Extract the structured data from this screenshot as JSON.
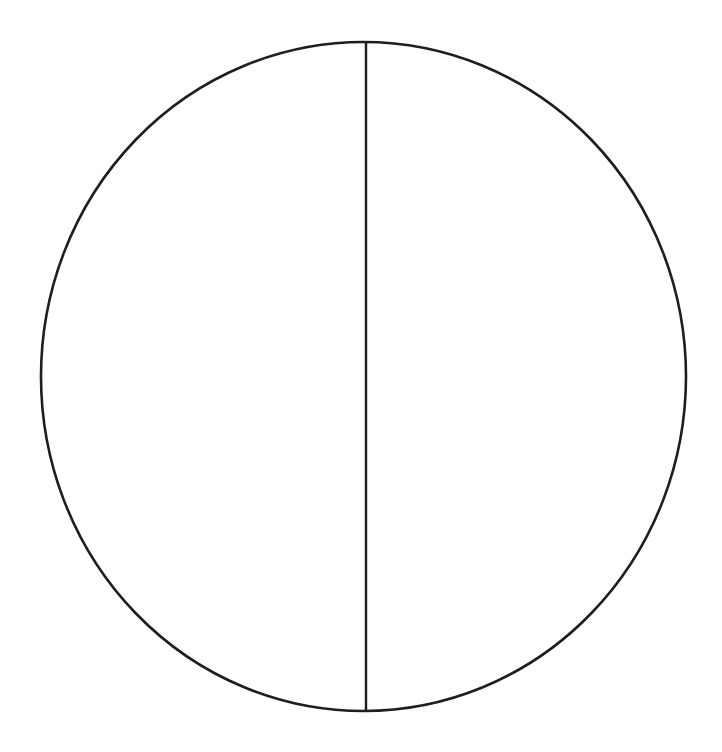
{
  "diagram": {
    "shape": "circle",
    "divisions": 2,
    "divider_orientation": "vertical",
    "parts": [
      {
        "name": "left-half",
        "fraction": 0.5,
        "label": ""
      },
      {
        "name": "right-half",
        "fraction": 0.5,
        "label": ""
      }
    ],
    "colors": {
      "background": "#ffffff",
      "stroke": "#1e1e1e",
      "fill": "#ffffff"
    }
  }
}
